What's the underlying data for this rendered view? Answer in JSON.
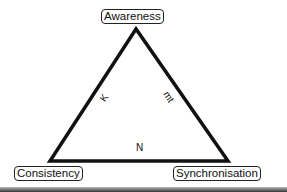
{
  "diagram": {
    "nodes": {
      "top": "Awareness",
      "bottom_left": "Consistency",
      "bottom_right": "Synchronisation"
    },
    "edges": {
      "left": "K",
      "right": "mt",
      "bottom": "N"
    },
    "line_color": "#111111"
  }
}
